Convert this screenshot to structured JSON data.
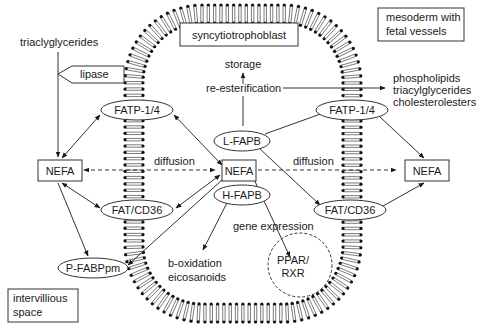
{
  "labels": {
    "syncytiotrophoblast": "syncytiotrophoblast",
    "mesoderm_line1": "mesoderm with",
    "mesoderm_line2": "fetal vessels",
    "intervillious_line1": "intervillious",
    "intervillious_line2": "space",
    "triaclyglycerides": "triaclyglycerides",
    "lipase": "lipase",
    "storage": "storage",
    "reesterification": "re-esterification",
    "products_line1": "phospholipids",
    "products_line2": "triacylglycerides",
    "products_line3": "cholesterolesters",
    "fatp_left": "FATP-1/4",
    "fatp_right": "FATP-1/4",
    "lfapb": "L-FAPB",
    "hfapb": "H-FAPB",
    "nefa_left": "NEFA",
    "nefa_center": "NEFA",
    "nefa_right": "NEFA",
    "diffusion_left": "diffusion",
    "diffusion_right": "diffusion",
    "fatcd36_left": "FAT/CD36",
    "fatcd36_right": "FAT/CD36",
    "pfabppm": "P-FABPpm",
    "gene_expression": "gene expression",
    "ppar_line1": "PPAR/",
    "ppar_line2": "RXR",
    "boxidation_line1": "b-oxidation",
    "boxidation_line2": "eicosanoids"
  }
}
